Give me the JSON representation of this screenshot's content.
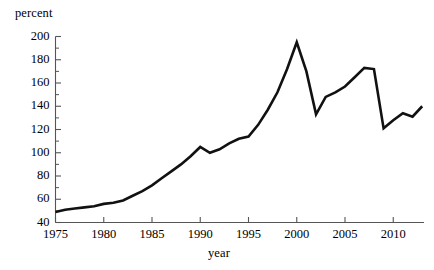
{
  "chart_data": {
    "type": "line",
    "title": "",
    "subtitle": "",
    "xlabel": "year",
    "ylabel": "percent",
    "grid": false,
    "legend": "none",
    "xlim": [
      1975,
      2013
    ],
    "ylim": [
      40,
      200
    ],
    "xticks": [
      1975,
      1980,
      1985,
      1990,
      1995,
      2000,
      2005,
      2010
    ],
    "xtick_labels": [
      "1975",
      "1980",
      "1985",
      "1990",
      "1995",
      "2000",
      "2005",
      "2010"
    ],
    "yticks": [
      40,
      60,
      80,
      100,
      120,
      140,
      160,
      180,
      200
    ],
    "ytick_labels": [
      "40",
      "60",
      "80",
      "100",
      "120",
      "140",
      "160",
      "180",
      "200"
    ],
    "yminor_step": 10,
    "line_color": "#111111",
    "line_width": 2.6,
    "series": [
      {
        "name": "percent",
        "x": [
          1975,
          1976,
          1977,
          1978,
          1979,
          1980,
          1981,
          1982,
          1983,
          1984,
          1985,
          1986,
          1987,
          1988,
          1989,
          1990,
          1991,
          1992,
          1993,
          1994,
          1995,
          1996,
          1997,
          1998,
          1999,
          2000,
          2001,
          2002,
          2003,
          2004,
          2005,
          2006,
          2007,
          2008,
          2009,
          2010,
          2011,
          2012,
          2013
        ],
        "values": [
          49,
          51,
          52,
          53,
          54,
          56,
          57,
          59,
          63,
          67,
          72,
          78,
          84,
          90,
          97,
          105,
          100,
          103,
          108,
          112,
          114,
          124,
          137,
          152,
          172,
          195,
          170,
          133,
          148,
          152,
          157,
          165,
          173,
          172,
          121,
          128,
          134,
          131,
          140
        ]
      }
    ]
  },
  "axes": {
    "y_title": "percent",
    "x_title": "year"
  }
}
